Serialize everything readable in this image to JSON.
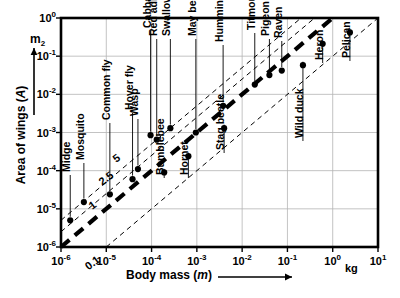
{
  "figure": {
    "kind": "log-log scatter plot",
    "background_color": "#ffffff",
    "ink_color": "#000000",
    "grid_color": "#b4b4b4"
  },
  "axes": {
    "x": {
      "label": "Body mass (m)",
      "unit": "kg",
      "arrow": "right-arrow",
      "scale": "log10",
      "range": [
        -6,
        1
      ],
      "tick_labels": [
        "10-6",
        "10-5",
        "10-4",
        "10-3",
        "10-2",
        "10-1",
        "100",
        "101"
      ],
      "tick_mantissa": [
        "10",
        "10",
        "10",
        "10",
        "10",
        "10",
        "10",
        "10"
      ],
      "tick_exponents": [
        "-6",
        "-5",
        "-4",
        "-3",
        "-2",
        "-1",
        "0",
        "1"
      ]
    },
    "y": {
      "label": "Area of wings (A)",
      "unit": "m2",
      "unit_mantissa": "m",
      "unit_exponent": "2",
      "arrow": "up-arrow",
      "scale": "log10",
      "range": [
        -6,
        0
      ],
      "tick_labels": [
        "100",
        "10-1",
        "10-2",
        "10-3",
        "10-4",
        "10-5",
        "10-6"
      ],
      "tick_mantissa": [
        "10",
        "10",
        "10",
        "10",
        "10",
        "10",
        "10"
      ],
      "tick_exponents": [
        "0",
        "-1",
        "-2",
        "-3",
        "-4",
        "-5",
        "-6"
      ]
    }
  },
  "reference_lines": [
    {
      "label": "0.1",
      "style": "thin-dashed",
      "intercept_log": -1.0
    },
    {
      "label": "1",
      "style": "thick-dashed",
      "intercept_log": 0.0
    },
    {
      "label": "2.5",
      "style": "thin-dashed",
      "intercept_log": 0.4
    },
    {
      "label": "5",
      "style": "thin-dashed",
      "intercept_log": 0.7
    }
  ],
  "chart_data": {
    "type": "scatter",
    "title": "",
    "xlabel": "Body mass (m)",
    "ylabel": "Area of wings (A)",
    "xunit": "kg",
    "yunit": "m2",
    "xscale": "log",
    "yscale": "log",
    "xlim": [
      1e-06,
      10
    ],
    "ylim": [
      1e-06,
      1
    ],
    "grid": true,
    "legend": "none",
    "annotations": [
      "0.1",
      "1",
      "2.5",
      "5"
    ],
    "points": [
      {
        "name": "Midge",
        "x": 1.6e-06,
        "y": 5e-06,
        "label_pos": "above"
      },
      {
        "name": "Mosquito",
        "x": 3.2e-06,
        "y": 1.5e-05,
        "label_pos": "above"
      },
      {
        "name": "Common fly",
        "x": 1.2e-05,
        "y": 2.4e-05,
        "label_pos": "above"
      },
      {
        "name": "Hover fly",
        "x": 3.8e-05,
        "y": 6e-05,
        "label_pos": "above"
      },
      {
        "name": "Wasp",
        "x": 5e-05,
        "y": 0.00011,
        "label_pos": "above"
      },
      {
        "name": "Cabbage butterfly",
        "x": 9.5e-05,
        "y": 0.00085,
        "label_pos": "above"
      },
      {
        "name": "Red admiral",
        "x": 0.00013,
        "y": 0.00065,
        "label_pos": "above"
      },
      {
        "name": "Swallowtail",
        "x": 0.00026,
        "y": 0.0013,
        "label_pos": "above"
      },
      {
        "name": "Bumblebee",
        "x": 0.00019,
        "y": 9e-05,
        "label_pos": "above"
      },
      {
        "name": "Hornet",
        "x": 0.00065,
        "y": 0.00024,
        "label_pos": "above"
      },
      {
        "name": "May beetle",
        "x": 0.00095,
        "y": 0.001,
        "label_pos": "above"
      },
      {
        "name": "Stag beetle",
        "x": 0.004,
        "y": 0.0013,
        "label_pos": "above"
      },
      {
        "name": "Hummingbird",
        "x": 0.0038,
        "y": 0.005,
        "label_pos": "above"
      },
      {
        "name": "Titmouse",
        "x": 0.019,
        "y": 0.018,
        "label_pos": "above"
      },
      {
        "name": "Pigeon",
        "x": 0.04,
        "y": 0.032,
        "label_pos": "above"
      },
      {
        "name": "Raven",
        "x": 0.075,
        "y": 0.042,
        "label_pos": "above"
      },
      {
        "name": "Wild duck",
        "x": 0.22,
        "y": 0.058,
        "label_pos": "above"
      },
      {
        "name": "Heron",
        "x": 0.6,
        "y": 0.21,
        "label_pos": "above"
      },
      {
        "name": "Pelican",
        "x": 2.4,
        "y": 0.42,
        "label_pos": "above"
      }
    ]
  }
}
